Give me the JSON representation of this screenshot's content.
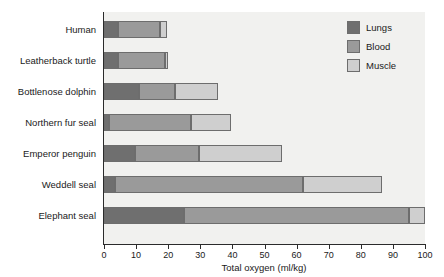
{
  "chart_data": {
    "type": "bar",
    "orientation": "horizontal",
    "stacked": true,
    "title": "",
    "xlabel": "Total oxygen (ml/kg)",
    "ylabel": "",
    "xlim": [
      0,
      100
    ],
    "xticks": [
      0,
      10,
      20,
      30,
      40,
      50,
      60,
      70,
      80,
      90,
      100
    ],
    "xticklabels": [
      "0",
      "10",
      "20",
      "30",
      "40",
      "50",
      "60",
      "70",
      "80",
      "90",
      "100"
    ],
    "grid": false,
    "legend_position": "top-right",
    "categories": [
      "Human",
      "Leatherback turtle",
      "Bottlenose dolphin",
      "Northern fur seal",
      "Emperor penguin",
      "Weddell seal",
      "Elephant seal"
    ],
    "series": [
      {
        "name": "Lungs",
        "color": "#6f6f6f",
        "values": [
          4.5,
          4.3,
          10.8,
          1.5,
          9.6,
          3.5,
          25.0
        ]
      },
      {
        "name": "Blood",
        "color": "#9a9a9a",
        "values": [
          13.0,
          14.7,
          11.2,
          25.5,
          19.9,
          58.5,
          70.0
        ]
      },
      {
        "name": "Muscle",
        "color": "#cfcfcf",
        "values": [
          2.0,
          1.0,
          13.5,
          12.7,
          25.8,
          24.5,
          5.0
        ]
      }
    ],
    "totals": [
      19.5,
      20.0,
      35.5,
      39.7,
      55.3,
      86.5,
      100.0
    ]
  },
  "legend": {
    "items": [
      {
        "label": "Lungs",
        "color": "#6f6f6f"
      },
      {
        "label": "Blood",
        "color": "#9a9a9a"
      },
      {
        "label": "Muscle",
        "color": "#cfcfcf"
      }
    ]
  }
}
